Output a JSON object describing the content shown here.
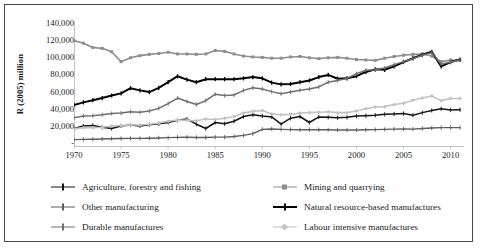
{
  "chart_data": {
    "type": "line",
    "title": "",
    "xlabel": "",
    "ylabel": "R (2005) million",
    "xlim": [
      1970,
      2011
    ],
    "ylim": [
      0,
      140000
    ],
    "grid": false,
    "legend_position": "bottom",
    "xtick_labels": [
      "1970",
      "1975",
      "1980",
      "1985",
      "1990",
      "1995",
      "2000",
      "2005",
      "2010"
    ],
    "xtick_values": [
      1970,
      1975,
      1980,
      1985,
      1990,
      1995,
      2000,
      2005,
      2010
    ],
    "ytick_labels": [
      "140,000",
      "120,000",
      "100,000",
      "80,000",
      "60,000",
      "40,000",
      "20,000",
      "-"
    ],
    "ytick_values": [
      140000,
      120000,
      100000,
      80000,
      60000,
      40000,
      20000,
      0
    ],
    "x": [
      1970,
      1971,
      1972,
      1973,
      1974,
      1975,
      1976,
      1977,
      1978,
      1979,
      1980,
      1981,
      1982,
      1983,
      1984,
      1985,
      1986,
      1987,
      1988,
      1989,
      1990,
      1991,
      1992,
      1993,
      1994,
      1995,
      1996,
      1997,
      1998,
      1999,
      2000,
      2001,
      2002,
      2003,
      2004,
      2005,
      2006,
      2007,
      2008,
      2009,
      2010,
      2011
    ],
    "series": [
      {
        "name": "Agriculture, forestry and fishing",
        "color": "#141414",
        "width": 1.5,
        "marker": "cross",
        "values": [
          17500,
          20500,
          21000,
          19000,
          17500,
          20500,
          21500,
          20500,
          22000,
          23000,
          24500,
          27000,
          28500,
          22500,
          17500,
          24500,
          23000,
          26000,
          31500,
          33500,
          32000,
          31000,
          22500,
          29500,
          31500,
          24500,
          31000,
          30500,
          30000,
          30500,
          32000,
          32500,
          33000,
          34000,
          34500,
          35000,
          33000,
          36000,
          38500,
          40500,
          39000,
          39500
        ]
      },
      {
        "name": "Mining and quarrying",
        "color": "#8e8e8e",
        "width": 1.6,
        "marker": "square",
        "values": [
          120000,
          117000,
          112000,
          111000,
          107000,
          95500,
          100000,
          102500,
          104000,
          105000,
          106500,
          104500,
          104500,
          104000,
          104500,
          108500,
          107500,
          104500,
          102000,
          101000,
          100500,
          99500,
          99500,
          101000,
          101500,
          100000,
          99000,
          100000,
          100500,
          99500,
          98000,
          97500,
          97000,
          99500,
          101500,
          103000,
          104000,
          104500,
          102000,
          95500,
          97500,
          97000
        ]
      },
      {
        "name": "Other manufacturing",
        "color": "#5c5c5c",
        "width": 1.4,
        "marker": "cross",
        "values": [
          4500,
          4800,
          5000,
          5200,
          5600,
          5800,
          6000,
          6000,
          6200,
          6500,
          6800,
          7200,
          7400,
          7000,
          7000,
          7400,
          7400,
          8200,
          9500,
          11500,
          16500,
          17000,
          16500,
          16200,
          16000,
          16200,
          16000,
          16000,
          15800,
          15800,
          15800,
          16000,
          16200,
          16500,
          16800,
          17000,
          16800,
          17500,
          18000,
          18500,
          18500,
          18500
        ]
      },
      {
        "name": "Natural resource-based manufactures",
        "color": "#000000",
        "width": 2.0,
        "marker": "cross",
        "values": [
          45000,
          48000,
          50500,
          53000,
          56000,
          58500,
          64500,
          62000,
          60000,
          65000,
          71500,
          78500,
          74500,
          71500,
          75000,
          75000,
          75000,
          75000,
          76000,
          77500,
          76000,
          71000,
          69000,
          69500,
          71500,
          73500,
          77500,
          80000,
          75500,
          76000,
          78500,
          83500,
          86500,
          86000,
          90000,
          95000,
          99500,
          103500,
          107000,
          90000,
          95000,
          98000
        ]
      },
      {
        "name": "Durable manufactures",
        "color": "#6e6e6e",
        "width": 1.5,
        "marker": "cross",
        "values": [
          30000,
          32000,
          32500,
          33500,
          35000,
          35500,
          37000,
          36500,
          38000,
          41000,
          46500,
          53000,
          49000,
          45500,
          50000,
          57500,
          56000,
          56500,
          62000,
          65000,
          63500,
          60500,
          58000,
          60000,
          62000,
          63500,
          66000,
          71500,
          73500,
          76000,
          81500,
          85500,
          86000,
          88000,
          92000,
          95500,
          99000,
          103000,
          106000,
          92500,
          95000,
          97500
        ]
      },
      {
        "name": "Labour intensive manufactures",
        "color": "#c2c2c2",
        "width": 1.6,
        "marker": "diamond",
        "values": [
          17000,
          18500,
          18500,
          19000,
          20500,
          21000,
          21500,
          21500,
          22500,
          24000,
          26000,
          27500,
          27000,
          26500,
          28500,
          28000,
          29500,
          31500,
          35500,
          37500,
          38500,
          34500,
          33500,
          34000,
          35500,
          36000,
          36500,
          37000,
          36000,
          36000,
          38000,
          40500,
          42500,
          43000,
          45500,
          47000,
          50500,
          53000,
          55500,
          50000,
          52500,
          52500
        ]
      }
    ]
  },
  "legend": {
    "left_column": [
      {
        "label": "Agriculture, forestry and fishing"
      },
      {
        "label": "Other manufacturing"
      },
      {
        "label": "Durable manufactures"
      }
    ],
    "right_column": [
      {
        "label": "Mining and quarrying"
      },
      {
        "label": "Natural resource-based manufactures"
      },
      {
        "label": "Labour intensive manufactures"
      }
    ]
  }
}
